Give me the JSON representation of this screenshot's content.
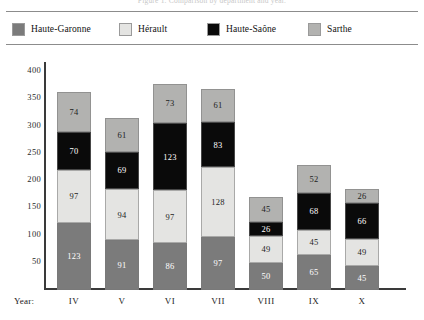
{
  "figure": {
    "cropped_caption": "Figure 1. Comparison by department and year.",
    "year_caption": "Year:"
  },
  "legend": {
    "items": [
      {
        "label": "Haute-Garonne",
        "color": "#7b7b7b",
        "x": 6
      },
      {
        "label": "Hérault",
        "color": "#e4e4e2",
        "x": 113
      },
      {
        "label": "Haute-Saône",
        "color": "#0a0a0a",
        "x": 201
      },
      {
        "label": "Sarthe",
        "color": "#b2b2b0",
        "x": 302
      }
    ]
  },
  "chart_data": {
    "type": "bar",
    "subtype": "stacked",
    "title": "",
    "xlabel": "Year:",
    "ylabel": "",
    "categories": [
      "IV",
      "V",
      "VI",
      "VII",
      "VIII",
      "IX",
      "X"
    ],
    "yticks": [
      50,
      100,
      150,
      200,
      250,
      300,
      350,
      400
    ],
    "ylim": [
      0,
      415
    ],
    "grid": false,
    "legend_position": "top",
    "series": [
      {
        "name": "Haute-Garonne",
        "color": "#7b7b7b",
        "label_color": "light",
        "values": [
          123,
          91,
          86,
          97,
          50,
          65,
          45
        ]
      },
      {
        "name": "Hérault",
        "color": "#e4e4e2",
        "label_color": "dark",
        "values": [
          97,
          94,
          97,
          128,
          49,
          45,
          49
        ]
      },
      {
        "name": "Haute-Saône",
        "color": "#0a0a0a",
        "label_color": "light",
        "values": [
          70,
          69,
          123,
          83,
          26,
          68,
          66
        ]
      },
      {
        "name": "Sarthe",
        "color": "#b2b2b0",
        "label_color": "dark",
        "values": [
          74,
          61,
          73,
          61,
          45,
          52,
          26
        ]
      }
    ],
    "totals": [
      364,
      315,
      379,
      369,
      170,
      230,
      186
    ]
  }
}
